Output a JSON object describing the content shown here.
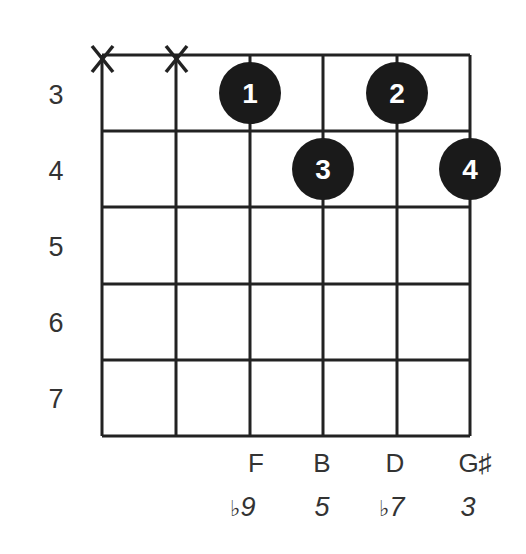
{
  "chord_diagram": {
    "fret_numbers": [
      "3",
      "4",
      "5",
      "6",
      "7"
    ],
    "muted_strings": [
      "X",
      "X"
    ],
    "fingers": [
      {
        "label": "1",
        "string": 3,
        "fret": 3
      },
      {
        "label": "2",
        "string": 5,
        "fret": 3
      },
      {
        "label": "3",
        "string": 4,
        "fret": 4
      },
      {
        "label": "4",
        "string": 6,
        "fret": 4
      }
    ],
    "notes": [
      "F",
      "B",
      "D",
      "G♯"
    ],
    "intervals": [
      {
        "accidental": "♭",
        "value": "9"
      },
      {
        "accidental": "",
        "value": "5"
      },
      {
        "accidental": "♭",
        "value": "7"
      },
      {
        "accidental": "",
        "value": "3"
      }
    ],
    "colors": {
      "line": "#222222",
      "dot": "#1a1a1a",
      "dot_text": "#ffffff"
    }
  }
}
